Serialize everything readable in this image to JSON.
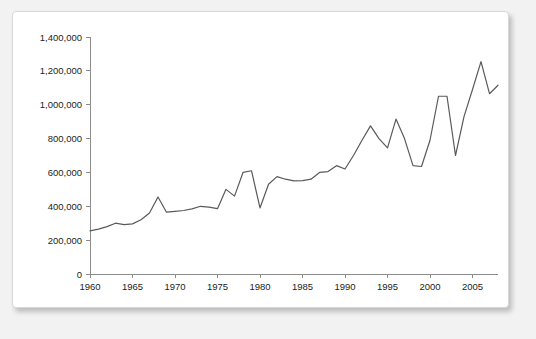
{
  "card": {
    "background": "#ffffff",
    "border_color": "#d8d8d8"
  },
  "chart_data": {
    "type": "line",
    "title": "",
    "subtitle": "",
    "xlabel": "",
    "ylabel": "",
    "xlim": [
      1960,
      2008
    ],
    "ylim": [
      0,
      1400000
    ],
    "grid": false,
    "legend": false,
    "legend_position": "none",
    "line_color": "#5a5a5a",
    "axis_color": "#8c8c8c",
    "y_ticks": [
      0,
      200000,
      400000,
      600000,
      800000,
      1000000,
      1200000,
      1400000
    ],
    "y_tick_labels": [
      "0",
      "200,000",
      "400,000",
      "600,000",
      "800,000",
      "1,000,000",
      "1,200,000",
      "1,400,000"
    ],
    "x_ticks": [
      1960,
      1965,
      1970,
      1975,
      1980,
      1985,
      1990,
      1995,
      2000,
      2005
    ],
    "x_tick_labels": [
      "1960",
      "1965",
      "1970",
      "1975",
      "1980",
      "1985",
      "1990",
      "1995",
      "2000",
      "2005"
    ],
    "x": [
      1960,
      1961,
      1962,
      1963,
      1964,
      1965,
      1966,
      1967,
      1968,
      1969,
      1970,
      1971,
      1972,
      1973,
      1974,
      1975,
      1976,
      1977,
      1978,
      1979,
      1980,
      1981,
      1982,
      1983,
      1984,
      1985,
      1986,
      1987,
      1988,
      1989,
      1990,
      1991,
      1992,
      1993,
      1994,
      1995,
      1996,
      1997,
      1998,
      1999,
      2000,
      2001,
      2002,
      2003,
      2004,
      2005,
      2006,
      2007,
      2008
    ],
    "series": [
      {
        "name": "Value",
        "values": [
          255000,
          265000,
          280000,
          300000,
          292000,
          296000,
          320000,
          360000,
          455000,
          365000,
          370000,
          375000,
          385000,
          400000,
          395000,
          386000,
          500000,
          460000,
          600000,
          610000,
          390000,
          530000,
          575000,
          560000,
          550000,
          552000,
          560000,
          600000,
          605000,
          640000,
          620000,
          700000,
          790000,
          875000,
          800000,
          745000,
          915000,
          800000,
          640000,
          635000,
          790000,
          1050000,
          1050000,
          700000,
          930000,
          1090000,
          1255000,
          1065000,
          1115000
        ]
      }
    ]
  }
}
